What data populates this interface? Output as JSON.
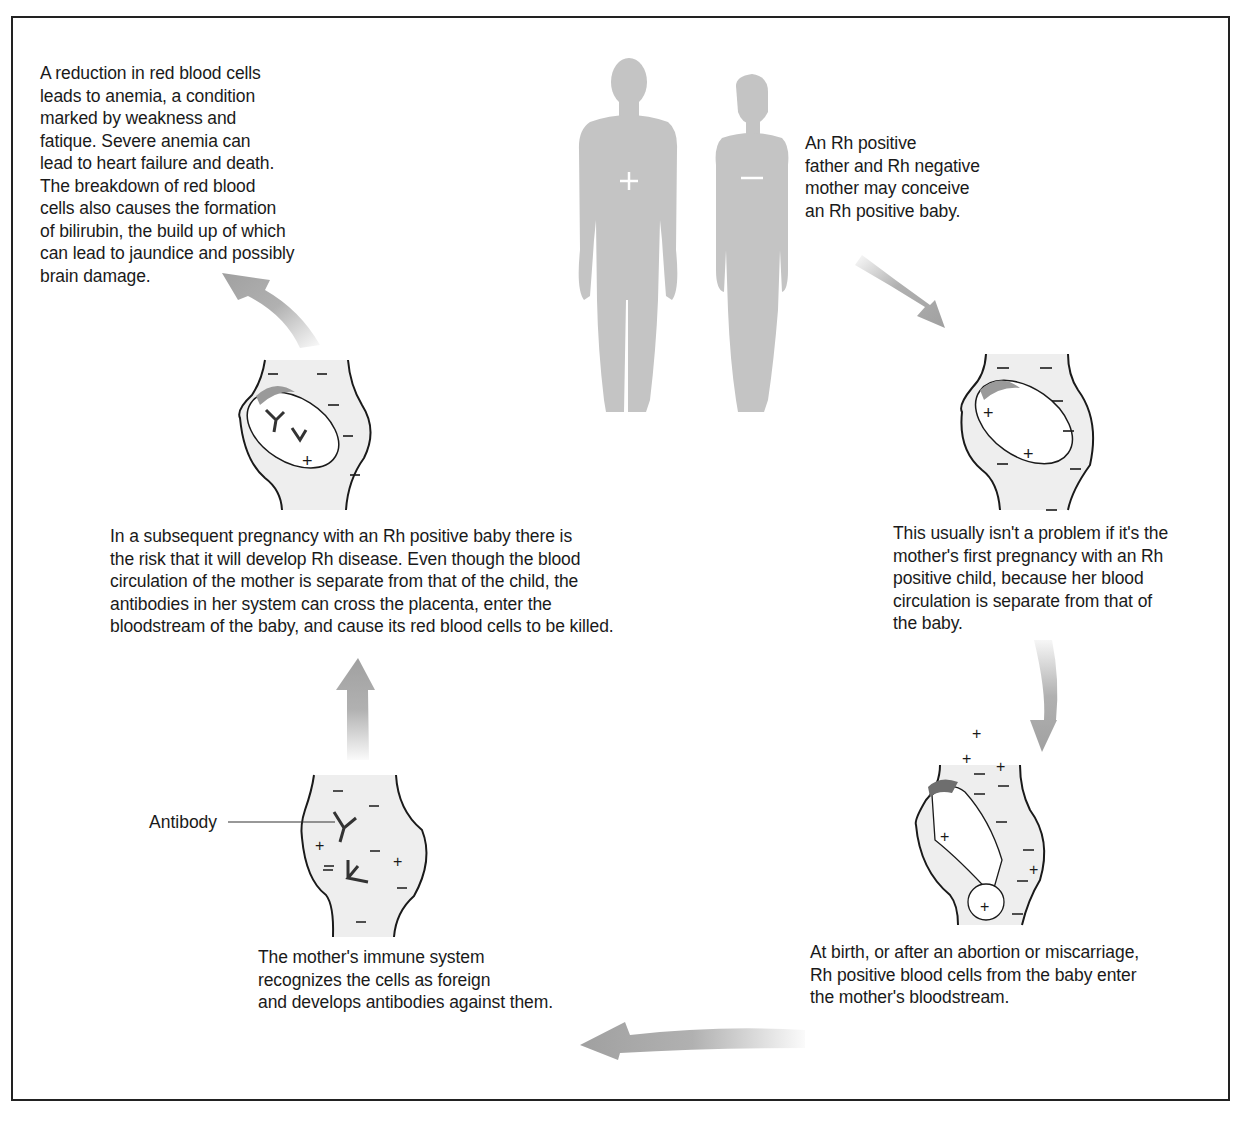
{
  "diagram": {
    "colors": {
      "border": "#222222",
      "silhouette": "#c4c4c4",
      "arrow": "#a8a8a8",
      "body_fill": "#eeeeee",
      "placenta": "#9a9a9a",
      "placenta_dark": "#6e6e6e",
      "line": "#1a1a1a"
    },
    "steps": [
      {
        "id": "parents",
        "text": "An Rh positive\nfather and Rh negative\nmother may conceive\nan Rh positive baby.",
        "father_sign": "+",
        "mother_sign": "−"
      },
      {
        "id": "first-pregnancy",
        "text": "This usually isn't a problem if it's the\nmother's first pregnancy with an Rh\npositive child, because her blood\ncirculation is separate from that of\nthe baby."
      },
      {
        "id": "birth",
        "text": "At birth, or after an abortion or miscarriage,\nRh positive blood cells from the baby enter\nthe mother's bloodstream."
      },
      {
        "id": "immune-response",
        "text": "The mother's immune system\nrecognizes the cells as foreign\nand develops antibodies against them.",
        "label": "Antibody"
      },
      {
        "id": "subsequent-pregnancy",
        "text": "In a subsequent pregnancy with an Rh positive baby there is\nthe risk that it will develop Rh disease. Even though the blood\ncirculation of the mother is separate from that of the child, the\nantibodies in her system can cross the placenta, enter the\nbloodstream of the baby, and cause its red blood cells to be killed."
      },
      {
        "id": "anemia",
        "text": "A reduction in red blood cells\nleads to anemia, a condition\nmarked by weakness and\nfatique. Severe anemia can\nlead to heart failure and death.\nThe breakdown of red blood\ncells also causes the formation\nof bilirubin, the build up of which\ncan lead to jaundice and possibly\nbrain damage."
      }
    ],
    "signs": {
      "plus": "+",
      "minus": "−"
    }
  }
}
